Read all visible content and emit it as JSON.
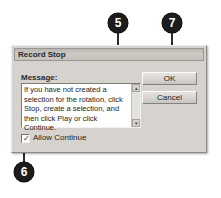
{
  "figure": {
    "callouts": [
      {
        "id": "callout-5",
        "label": "5"
      },
      {
        "id": "callout-7",
        "label": "7"
      },
      {
        "id": "callout-6",
        "label": "6"
      }
    ],
    "marker_color": "#1c1c1c",
    "leader_color": "#2b2b2b"
  },
  "dialog": {
    "title": "Record Stop",
    "message_label": "Message:",
    "message_value": "If you have not created a selection for the rotation, click Stop, create a selection, and then click Play or click Continue.",
    "scrollbar": {
      "up_arrow": "▴",
      "down_arrow": "▾"
    },
    "allow_continue": {
      "label": "Allow Continue",
      "checked": true,
      "check_glyph": "✓"
    },
    "buttons": {
      "ok": "OK",
      "cancel": "Cancel"
    },
    "colors": {
      "face": "#d6d3ce",
      "titlebar": "#c4c1bb",
      "field": "#ffffff"
    }
  }
}
